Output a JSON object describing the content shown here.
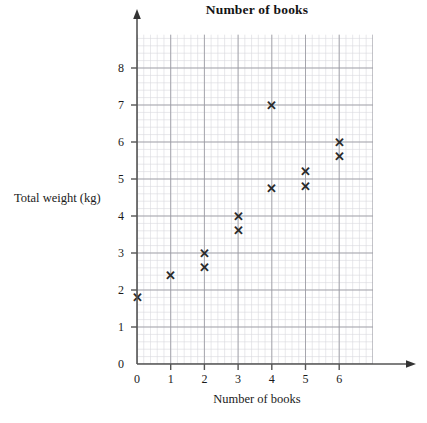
{
  "chart_data": {
    "type": "scatter",
    "title": "Number of books",
    "xlabel": "Number of books",
    "ylabel": "Total weight (kg)",
    "xlim": [
      0,
      7
    ],
    "ylim": [
      0,
      8.9
    ],
    "xticks": [
      "0",
      "1",
      "2",
      "3",
      "4",
      "5",
      "6"
    ],
    "xtick_values": [
      0,
      1,
      2,
      3,
      4,
      5,
      6
    ],
    "yticks": [
      "0",
      "1",
      "2",
      "3",
      "4",
      "5",
      "6",
      "7",
      "8"
    ],
    "ytick_values": [
      0,
      1,
      2,
      3,
      4,
      5,
      6,
      7,
      8
    ],
    "grid": true,
    "grid_minor_step": 0.2,
    "grid_major_step": 1,
    "legend": null,
    "marker": "x",
    "marker_color": "#2b2b2b",
    "points": [
      {
        "x": 0,
        "y": 1.8
      },
      {
        "x": 1,
        "y": 2.4
      },
      {
        "x": 2,
        "y": 3.0
      },
      {
        "x": 2,
        "y": 2.6
      },
      {
        "x": 3,
        "y": 4.0
      },
      {
        "x": 3,
        "y": 3.6
      },
      {
        "x": 4,
        "y": 7.0
      },
      {
        "x": 4,
        "y": 4.75
      },
      {
        "x": 5,
        "y": 5.2
      },
      {
        "x": 5,
        "y": 4.8
      },
      {
        "x": 6,
        "y": 6.0
      },
      {
        "x": 6,
        "y": 5.6
      }
    ]
  },
  "colors": {
    "background": "#ffffff",
    "axis": "#555555",
    "grid_minor": "#d8d8dd",
    "grid_major": "#9a9aa2",
    "text": "#1a1a1a",
    "marker": "#2b2b2b"
  },
  "axis_origin_label": "0"
}
